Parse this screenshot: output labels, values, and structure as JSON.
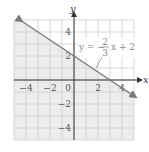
{
  "chart_data": {
    "type": "line",
    "title": "",
    "xlabel": "x",
    "ylabel": "y",
    "xlim": [
      -5,
      5
    ],
    "ylim": [
      -5,
      5
    ],
    "grid": true,
    "x_ticks": [
      -4,
      -2,
      0,
      2,
      4
    ],
    "y_ticks": [
      4,
      2,
      -2,
      -4
    ],
    "x_tick_labels": [
      "−4",
      "−2",
      "0",
      "2",
      "4"
    ],
    "y_tick_labels": [
      "4",
      "2",
      "−2",
      "−4"
    ],
    "series": [
      {
        "name": "y = −(2/3)x + 2",
        "slope": -0.6667,
        "intercept": 2,
        "x": [
          -4.5,
          5
        ],
        "y": [
          5,
          -1.33
        ],
        "arrows": "both"
      }
    ],
    "shaded_region": "below line (y ≤ −(2/3)x + 2)",
    "annotation": {
      "text_prefix": "y = −",
      "fraction_num": "2",
      "fraction_den": "3",
      "text_suffix": "x + 2",
      "points_to": [
        1.8,
        0.8
      ]
    },
    "colors": {
      "line": "#7a7a7a",
      "grid": "#cfcfcf",
      "axis": "#333333",
      "shade": "#ececec"
    }
  }
}
